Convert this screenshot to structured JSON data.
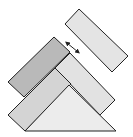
{
  "diagram": {
    "width": 133,
    "height": 137,
    "stroke_color": "#222222",
    "shapes": [
      {
        "id": "top-right-block",
        "type": "rectangle",
        "fill": "#e4e4e4",
        "points": "65,24 79,9 128,56 112,72"
      },
      {
        "id": "dark-block",
        "type": "rectangle",
        "fill": "#b9b9b9",
        "points": "8,82 54,37 70,52 24,97"
      },
      {
        "id": "middle-right-block",
        "type": "rectangle",
        "fill": "#e2e2e2",
        "points": "55,68 70,53 115,100 100,115"
      },
      {
        "id": "lower-left-block",
        "type": "rectangle",
        "fill": "#d4d4d4",
        "points": "8,115 55,68 71,84 25,131"
      },
      {
        "id": "triangle",
        "type": "triangle",
        "fill": "#ececec",
        "points": "25,131 69,85 116,131"
      }
    ],
    "arrow": {
      "from": [
        67,
        43
      ],
      "to": [
        78,
        52
      ],
      "type": "double-headed"
    }
  }
}
